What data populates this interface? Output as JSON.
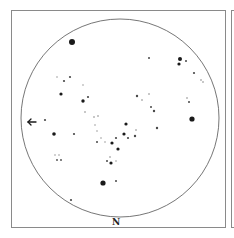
{
  "chart_data": {
    "type": "scatter",
    "title": "",
    "direction_label": "N",
    "pointer": "left-arrow",
    "circle": {
      "cx": 120,
      "cy": 118,
      "r": 99
    },
    "stars": [
      {
        "x": 72,
        "y": 42,
        "size": 3
      },
      {
        "x": 149,
        "y": 58,
        "size": 1
      },
      {
        "x": 180,
        "y": 59,
        "size": 2
      },
      {
        "x": 186,
        "y": 61,
        "size": 1
      },
      {
        "x": 179,
        "y": 64,
        "size": 1.6
      },
      {
        "x": 194,
        "y": 73,
        "size": 1.1
      },
      {
        "x": 201,
        "y": 80,
        "size": 0.8
      },
      {
        "x": 203,
        "y": 82,
        "size": 0.8
      },
      {
        "x": 57,
        "y": 77,
        "size": 0.7
      },
      {
        "x": 64,
        "y": 81,
        "size": 1.1
      },
      {
        "x": 70,
        "y": 77,
        "size": 1.1
      },
      {
        "x": 83,
        "y": 85,
        "size": 0.7
      },
      {
        "x": 61,
        "y": 94,
        "size": 1.6
      },
      {
        "x": 88,
        "y": 97,
        "size": 1.1
      },
      {
        "x": 83,
        "y": 101,
        "size": 1.7
      },
      {
        "x": 137,
        "y": 96,
        "size": 1.2
      },
      {
        "x": 149,
        "y": 94,
        "size": 0.8
      },
      {
        "x": 142,
        "y": 100,
        "size": 0.8
      },
      {
        "x": 187,
        "y": 98,
        "size": 0.8
      },
      {
        "x": 189,
        "y": 102,
        "size": 1
      },
      {
        "x": 151,
        "y": 107,
        "size": 1
      },
      {
        "x": 154,
        "y": 111,
        "size": 1.2
      },
      {
        "x": 85,
        "y": 112,
        "size": 0.8
      },
      {
        "x": 94,
        "y": 117,
        "size": 0.8
      },
      {
        "x": 98,
        "y": 116,
        "size": 0.8
      },
      {
        "x": 192,
        "y": 119,
        "size": 2.6
      },
      {
        "x": 45,
        "y": 120,
        "size": 1.1
      },
      {
        "x": 95,
        "y": 125,
        "size": 0.7
      },
      {
        "x": 126,
        "y": 124,
        "size": 1.6
      },
      {
        "x": 157,
        "y": 128,
        "size": 1.2
      },
      {
        "x": 136,
        "y": 130,
        "size": 0.8
      },
      {
        "x": 54,
        "y": 134,
        "size": 1.8
      },
      {
        "x": 74,
        "y": 134,
        "size": 1.1
      },
      {
        "x": 97,
        "y": 131,
        "size": 0.7
      },
      {
        "x": 124,
        "y": 134,
        "size": 1.6
      },
      {
        "x": 128,
        "y": 138,
        "size": 1.1
      },
      {
        "x": 135,
        "y": 136,
        "size": 1.2
      },
      {
        "x": 101,
        "y": 138,
        "size": 0.7
      },
      {
        "x": 105,
        "y": 142,
        "size": 0.7
      },
      {
        "x": 97,
        "y": 142,
        "size": 1
      },
      {
        "x": 116,
        "y": 138,
        "size": 1.1
      },
      {
        "x": 112,
        "y": 143,
        "size": 1.6
      },
      {
        "x": 118,
        "y": 149,
        "size": 1.6
      },
      {
        "x": 55,
        "y": 155,
        "size": 0.7
      },
      {
        "x": 59,
        "y": 155,
        "size": 0.7
      },
      {
        "x": 57,
        "y": 160,
        "size": 0.9
      },
      {
        "x": 61,
        "y": 160,
        "size": 0.9
      },
      {
        "x": 110,
        "y": 157,
        "size": 0.8
      },
      {
        "x": 107,
        "y": 161,
        "size": 1
      },
      {
        "x": 111,
        "y": 163,
        "size": 1.6
      },
      {
        "x": 116,
        "y": 161,
        "size": 0.7
      },
      {
        "x": 103,
        "y": 183,
        "size": 2.6
      },
      {
        "x": 116,
        "y": 181,
        "size": 1
      },
      {
        "x": 71,
        "y": 200,
        "size": 1.1
      }
    ],
    "annotations": [
      {
        "type": "arrow",
        "direction": "left",
        "x": 32,
        "y": 122
      },
      {
        "type": "text",
        "text": "N",
        "x": 115,
        "y": 224
      }
    ],
    "grid": false,
    "legend": null
  },
  "labels": {
    "north": "N"
  },
  "colors": {
    "frame": "#8a8a8a",
    "circle": "#666666",
    "star": "#1a1a1a"
  }
}
